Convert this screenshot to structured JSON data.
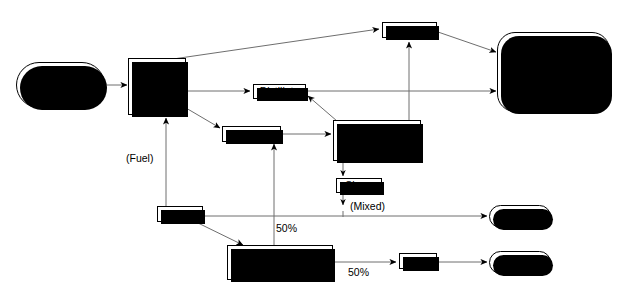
{
  "diagram": {
    "colors": {
      "line": "#6e6e6e",
      "outline": "#000000",
      "shadow": "#000000",
      "background": "#ffffff"
    },
    "nodes": {
      "crude_oil": {
        "label": "Crude\nOil",
        "shape": "stadium"
      },
      "main_crude_unit": {
        "label": "Main\nCrude\nUnit",
        "shape": "rect"
      },
      "distillate": {
        "label": "Distillate",
        "shape": "tag"
      },
      "gasoils": {
        "label": "Gasoils",
        "shape": "tag"
      },
      "gasoline": {
        "label": "Gasoline",
        "shape": "tag"
      },
      "catalytic_cracker": {
        "label": "Catalytic\nCracker",
        "shape": "rect"
      },
      "slurry": {
        "label": "Slurry",
        "shape": "tag"
      },
      "asphalt": {
        "label": "Asphalt",
        "shape": "tag"
      },
      "propane_deasphalting": {
        "label": "Propane\nDeasphalting",
        "shape": "rect"
      },
      "pitch": {
        "label": "Pitch",
        "shape": "tag"
      },
      "downstream_operations": {
        "label": "Downstream\nOperations",
        "shape": "roundrect"
      },
      "market_top": {
        "label": "Market",
        "shape": "stadium"
      },
      "market_bottom": {
        "label": "Market",
        "shape": "stadium"
      }
    },
    "edge_labels": {
      "fuel": "(Fuel)",
      "mixed": "(Mixed)",
      "split_up": "50%",
      "split_right": "50%"
    },
    "flows": [
      {
        "from": "crude_oil",
        "to": "main_crude_unit",
        "label": ""
      },
      {
        "from": "main_crude_unit",
        "to": "gasoline",
        "label": ""
      },
      {
        "from": "main_crude_unit",
        "to": "distillate",
        "label": ""
      },
      {
        "from": "main_crude_unit",
        "to": "gasoils",
        "label": ""
      },
      {
        "from": "gasoils",
        "to": "catalytic_cracker",
        "label": ""
      },
      {
        "from": "catalytic_cracker",
        "to": "distillate",
        "label": ""
      },
      {
        "from": "catalytic_cracker",
        "to": "gasoline",
        "label": ""
      },
      {
        "from": "catalytic_cracker",
        "to": "slurry",
        "label": ""
      },
      {
        "from": "gasoline",
        "to": "downstream_operations",
        "label": ""
      },
      {
        "from": "distillate",
        "to": "downstream_operations",
        "label": ""
      },
      {
        "from": "slurry",
        "to": "market_top",
        "label": "(Mixed)"
      },
      {
        "from": "asphalt",
        "to": "main_crude_unit",
        "label": "(Fuel)"
      },
      {
        "from": "asphalt",
        "to": "market_top",
        "label": ""
      },
      {
        "from": "asphalt",
        "to": "propane_deasphalting",
        "label": ""
      },
      {
        "from": "propane_deasphalting",
        "to": "gasoils",
        "label": "50%"
      },
      {
        "from": "propane_deasphalting",
        "to": "pitch",
        "label": "50%"
      },
      {
        "from": "pitch",
        "to": "market_bottom",
        "label": ""
      }
    ]
  }
}
